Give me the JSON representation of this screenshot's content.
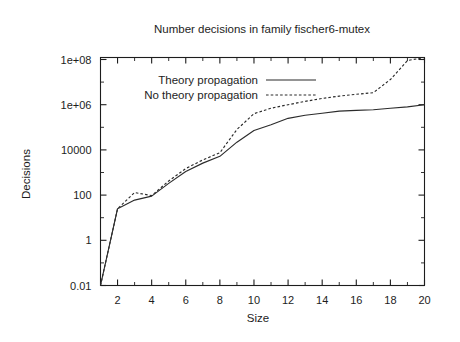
{
  "chart_data": {
    "type": "line",
    "title": "Number decisions in family fischer6-mutex",
    "xlabel": "Size",
    "ylabel": "Decisions",
    "yscale": "log",
    "xlim": [
      1,
      20
    ],
    "ylim": [
      0.01,
      200000000
    ],
    "grid": false,
    "legend_position": "upper-left-inside",
    "xticks": [
      "2",
      "4",
      "6",
      "8",
      "10",
      "12",
      "14",
      "16",
      "18",
      "20"
    ],
    "xtick_values": [
      2,
      4,
      6,
      8,
      10,
      12,
      14,
      16,
      18,
      20
    ],
    "yticks": [
      "0.01",
      "1",
      "100",
      "10000",
      "1e+06",
      "1e+08"
    ],
    "ytick_values": [
      0.01,
      1,
      100,
      10000,
      1000000,
      100000000
    ],
    "x": [
      1,
      2,
      3,
      4,
      5,
      6,
      7,
      8,
      9,
      10,
      11,
      12,
      13,
      14,
      15,
      16,
      17,
      18,
      19,
      20
    ],
    "series": [
      {
        "name": "Theory propagation",
        "style": "solid",
        "values": [
          0.01,
          25,
          60,
          90,
          330,
          1100,
          2600,
          5200,
          22000,
          72000,
          130000,
          250000,
          340000,
          420000,
          520000,
          560000,
          600000,
          700000,
          800000,
          1000000
        ]
      },
      {
        "name": "No theory propagation",
        "style": "dotted",
        "values": [
          0.01,
          25,
          130,
          95,
          420,
          1500,
          3600,
          7500,
          80000,
          400000,
          700000,
          1000000,
          1400000,
          1900000,
          2400000,
          2900000,
          3400000,
          13000000,
          90000000,
          170000000
        ]
      }
    ]
  },
  "legend": {
    "entries": [
      {
        "label": "Theory propagation",
        "style": "solid"
      },
      {
        "label": "No theory propagation",
        "style": "dotted"
      }
    ]
  }
}
